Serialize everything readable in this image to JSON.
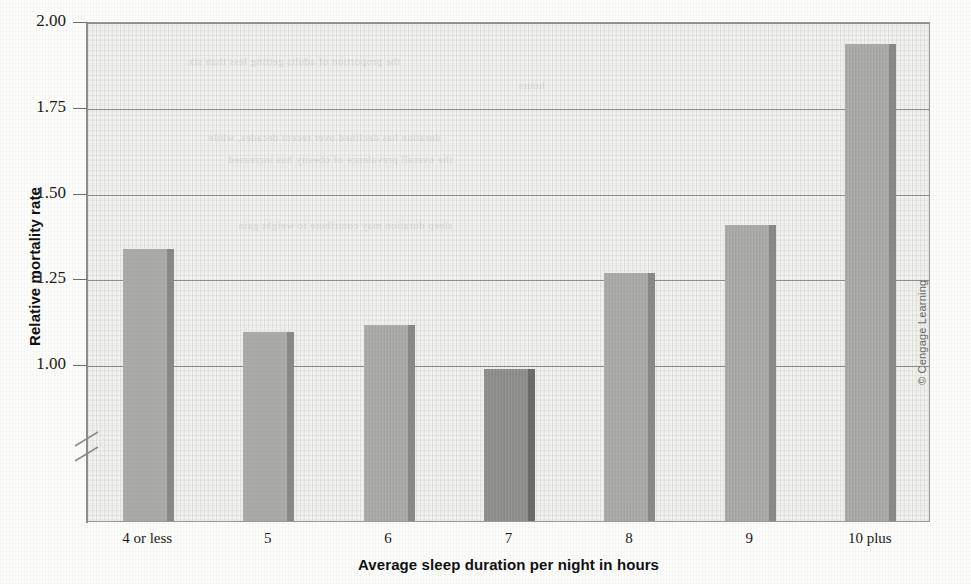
{
  "chart_data": {
    "type": "bar",
    "title": "",
    "xlabel": "Average sleep duration per night in hours",
    "ylabel": "Relative mortality rate",
    "categories": [
      "4 or less",
      "5",
      "6",
      "7",
      "8",
      "9",
      "10 plus"
    ],
    "values": [
      1.34,
      1.1,
      1.12,
      0.99,
      1.27,
      1.41,
      1.94
    ],
    "highlight_index": 3,
    "ylim": [
      0.8,
      2.0
    ],
    "yticks": [
      1.0,
      1.25,
      1.5,
      1.75,
      2.0
    ],
    "ytick_labels": [
      "1.00",
      "1.25",
      "1.50",
      "1.75",
      "2.00"
    ],
    "grid": true,
    "axis_break": true,
    "legend": null,
    "colors": {
      "bar": "#a9a9a5",
      "bar_side": "#8a8a86",
      "bar_highlight": "#8d8d89",
      "bar_highlight_side": "#6d6d69",
      "plot_background": "#f1f1ee",
      "gridline": "#8e8e8a",
      "axis": "#8e8e8a",
      "text": "#1b1b1b"
    }
  },
  "credit": {
    "text": "© Cengage Learning"
  },
  "bleed_text": {
    "lines": [
      "the proportion of adults getting less than six",
      "hours",
      "duration has declined over recent decades, while",
      "the overall prevalence of obesity has increased",
      "sleep duration may contribute to weight gain"
    ]
  }
}
